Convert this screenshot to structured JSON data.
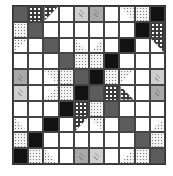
{
  "quilt": {
    "title": "",
    "grid_size": [
      10,
      10
    ],
    "palette": {
      "D": "#5c5c5c",
      "K": "#121212",
      "W": "#ffffff",
      "L1": "#cfcfcf",
      "L2": "#a9a9a9",
      "P": "dark-dotted",
      "C": "light-check"
    },
    "rows": [
      [
        {
          "f": "D"
        },
        {
          "f": "P"
        },
        {
          "f": "P",
          "t": "tri-tl"
        },
        {
          "f": "W"
        },
        {
          "f": "L1"
        },
        {
          "f": "L2"
        },
        {
          "f": "W"
        },
        {
          "f": "C",
          "t": "tri-tr"
        },
        {
          "f": "C"
        },
        {
          "f": "K"
        }
      ],
      [
        {
          "f": "C"
        },
        {
          "f": "D"
        },
        {
          "f": "W"
        },
        {
          "f": "W"
        },
        {
          "f": "W"
        },
        {
          "f": "W"
        },
        {
          "f": "W"
        },
        {
          "f": "W"
        },
        {
          "f": "K"
        },
        {
          "f": "P"
        }
      ],
      [
        {
          "f": "C",
          "t": "tri-tl"
        },
        {
          "f": "W"
        },
        {
          "f": "D"
        },
        {
          "f": "W"
        },
        {
          "f": "C",
          "t": "tri-bl"
        },
        {
          "f": "C",
          "t": "tri-br"
        },
        {
          "f": "W"
        },
        {
          "f": "K"
        },
        {
          "f": "W"
        },
        {
          "f": "P",
          "t": "tri-tr"
        }
      ],
      [
        {
          "f": "W"
        },
        {
          "f": "W"
        },
        {
          "f": "W"
        },
        {
          "f": "D"
        },
        {
          "f": "C"
        },
        {
          "f": "C"
        },
        {
          "f": "K"
        },
        {
          "f": "W"
        },
        {
          "f": "W"
        },
        {
          "f": "W"
        }
      ],
      [
        {
          "f": "L2"
        },
        {
          "f": "W"
        },
        {
          "f": "C",
          "t": "tri-tr"
        },
        {
          "f": "C"
        },
        {
          "f": "D"
        },
        {
          "f": "K"
        },
        {
          "f": "C"
        },
        {
          "f": "C",
          "t": "tri-tl"
        },
        {
          "f": "W"
        },
        {
          "f": "L1"
        }
      ],
      [
        {
          "f": "L1"
        },
        {
          "f": "W"
        },
        {
          "f": "C",
          "t": "tri-br"
        },
        {
          "f": "C"
        },
        {
          "f": "K"
        },
        {
          "f": "D"
        },
        {
          "f": "P"
        },
        {
          "f": "P",
          "t": "tri-bl"
        },
        {
          "f": "W"
        },
        {
          "f": "L2"
        }
      ],
      [
        {
          "f": "W"
        },
        {
          "f": "W"
        },
        {
          "f": "W"
        },
        {
          "f": "K"
        },
        {
          "f": "P"
        },
        {
          "f": "C"
        },
        {
          "f": "D"
        },
        {
          "f": "W"
        },
        {
          "f": "W"
        },
        {
          "f": "W"
        }
      ],
      [
        {
          "f": "C",
          "t": "tri-bl"
        },
        {
          "f": "W"
        },
        {
          "f": "K"
        },
        {
          "f": "W"
        },
        {
          "f": "P",
          "t": "tri-tl"
        },
        {
          "f": "C",
          "t": "tri-tr"
        },
        {
          "f": "W"
        },
        {
          "f": "D"
        },
        {
          "f": "W"
        },
        {
          "f": "C",
          "t": "tri-br"
        }
      ],
      [
        {
          "f": "C"
        },
        {
          "f": "K"
        },
        {
          "f": "W"
        },
        {
          "f": "W"
        },
        {
          "f": "W"
        },
        {
          "f": "W"
        },
        {
          "f": "W"
        },
        {
          "f": "W"
        },
        {
          "f": "D"
        },
        {
          "f": "C"
        }
      ],
      [
        {
          "f": "K"
        },
        {
          "f": "C"
        },
        {
          "f": "C",
          "t": "tri-bl"
        },
        {
          "f": "W"
        },
        {
          "f": "L2"
        },
        {
          "f": "L1"
        },
        {
          "f": "W"
        },
        {
          "f": "C",
          "t": "tri-br"
        },
        {
          "f": "C"
        },
        {
          "f": "D"
        }
      ]
    ]
  }
}
